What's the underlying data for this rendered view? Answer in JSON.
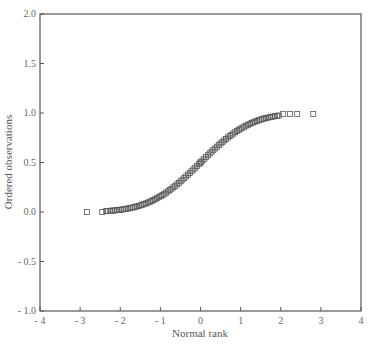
{
  "chart_data": {
    "type": "scatter",
    "title": "",
    "xlabel": "Normal rank",
    "ylabel": "Ordered observations",
    "xlim": [
      -4,
      4
    ],
    "ylim": [
      -1.0,
      2.0
    ],
    "xticks": [
      -4,
      -3,
      -2,
      -1,
      0,
      1,
      2,
      3,
      4
    ],
    "xtick_labels": [
      "- 4",
      "- 3",
      "- 2",
      "- 1",
      "0",
      "1",
      "2",
      "3",
      "4"
    ],
    "yticks": [
      -1.0,
      -0.5,
      0.0,
      0.5,
      1.0,
      1.5,
      2.0
    ],
    "ytick_labels": [
      "- 1.0",
      "- 0.5",
      "0.0",
      "0.5",
      "1.0",
      "1.5",
      "2.0"
    ],
    "grid": false,
    "legend": null,
    "marker": "open-square",
    "marker_color": "#555555",
    "data_provenance": "Approximate reconstruction. Tail points (x approx -2.83, -2.45, 2.06, 2.23, 2.41, 2.81) and the midpoint (0, 0.5) were measured from the image; the dense central band could not be resolved into individual markers, so the points between are a smooth normal-CDF-shaped curve sampled at evenly spaced ranks, clipped to [0, 1]. Do not treat individual central values as measured.",
    "points_measured": [
      {
        "x": -2.83,
        "y": 0.0
      },
      {
        "x": -2.45,
        "y": 0.0
      },
      {
        "x": 0.0,
        "y": 0.5
      },
      {
        "x": 2.06,
        "y": 0.99
      },
      {
        "x": 2.23,
        "y": 0.99
      },
      {
        "x": 2.41,
        "y": 0.99
      },
      {
        "x": 2.81,
        "y": 0.99
      }
    ],
    "points_approximated": {
      "method": "y = Phi(x), clipped to [0,1]",
      "x_range": [
        -2.35,
        1.95
      ],
      "count": 96
    }
  }
}
